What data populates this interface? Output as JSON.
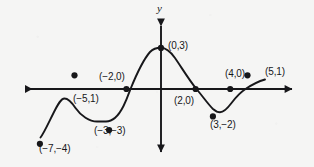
{
  "figure": {
    "title": "",
    "background_color": "#f5f5f4",
    "ink_color": "#17171a"
  },
  "axes": {
    "y_axis_label": "y",
    "x_axis_label": "",
    "origin_px": {
      "x": 161,
      "y": 89
    },
    "x_unit_px": 17.3,
    "y_unit_px": 13.7,
    "x_axis_left_tip_px": 17,
    "x_axis_right_tip_px": 300,
    "y_axis_top_tip_px": 18,
    "y_axis_bottom_tip_px": 160,
    "arrows": [
      "left",
      "right",
      "up",
      "down"
    ]
  },
  "chart_data": {
    "type": "line",
    "title": "",
    "xlabel": "",
    "ylabel": "y",
    "grid": false,
    "legend": "none",
    "xlim": [
      -8.3,
      8.0
    ],
    "ylim": [
      -5.2,
      5.2
    ],
    "series": [
      {
        "name": "curve",
        "marked_points": [
          {
            "label": "(−7,−4)",
            "x": -7,
            "y": -4
          },
          {
            "label": "(−5,1)",
            "x": -5,
            "y": 1
          },
          {
            "label": "(−3,−3)",
            "x": -3,
            "y": -3
          },
          {
            "label": "(−2,0)",
            "x": -2,
            "y": 0
          },
          {
            "label": "(0,3)",
            "x": 0,
            "y": 3
          },
          {
            "label": "(2,0)",
            "x": 2,
            "y": 0
          },
          {
            "label": "(3,−2)",
            "x": 3,
            "y": -2
          },
          {
            "label": "(4,0)",
            "x": 4,
            "y": 0
          },
          {
            "label": "(5,1)",
            "x": 5,
            "y": 1
          }
        ]
      }
    ],
    "annotations": [
      {
        "name": "label-neg7-neg4",
        "text": "(−7,−4)",
        "px": {
          "x": 39,
          "y": 143
        }
      },
      {
        "name": "label-neg5-1",
        "text": "(−5,1)",
        "px": {
          "x": 73,
          "y": 93
        }
      },
      {
        "name": "label-neg3-neg3",
        "text": "(−3,−3)",
        "px": {
          "x": 94,
          "y": 125
        }
      },
      {
        "name": "label-neg2-0",
        "text": "(−2,0)",
        "px": {
          "x": 99,
          "y": 71
        }
      },
      {
        "name": "label-0-3",
        "text": "(0,3)",
        "px": {
          "x": 168,
          "y": 40
        }
      },
      {
        "name": "label-2-0",
        "text": "(2,0)",
        "px": {
          "x": 174,
          "y": 95
        }
      },
      {
        "name": "label-3-neg2",
        "text": "(3,−2)",
        "px": {
          "x": 210,
          "y": 119
        }
      },
      {
        "name": "label-4-0",
        "text": "(4,0)",
        "px": {
          "x": 225,
          "y": 68
        }
      },
      {
        "name": "label-5-1",
        "text": "(5,1)",
        "px": {
          "x": 265,
          "y": 66
        }
      }
    ],
    "curve_path_px": "M 40.5,137.5 C 44,133 48,124 53.5,113 C 58,104 61,98.5 64.5,98.5 C 68,98.5 71.5,102 75.5,108 C 81,116 89.5,121.5 97,121.5 C 101,121.5 104,121.5 106,121.5 C 112,121.5 118,117 123.5,106 C 127,99 129,93 130.5,89 C 136,75.5 143,60 150,52 C 154,47.8 158,47.8 161,47.8 C 165,47.8 170,51 175,58 C 181,66.5 189,80 196.5,89 C 202,95.5 208,104 213,109 C 216,111.6 218,112.3 220,112.3 C 223,112.3 227,109 231.5,103 C 236,97 241,92 245.5,89 C 251,85.3 258,81.5 265,79.5"
  }
}
